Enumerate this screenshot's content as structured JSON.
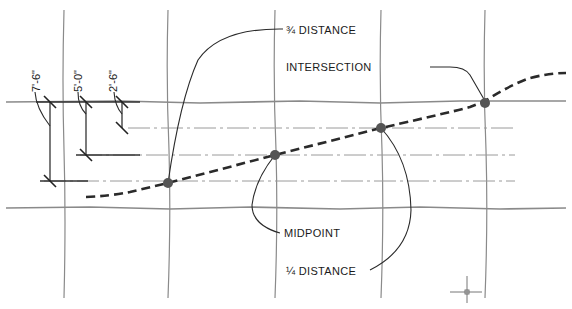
{
  "diagram": {
    "type": "cad-drawing",
    "labels": {
      "three_quarter": "¾ DISTANCE",
      "intersection": "INTERSECTION",
      "midpoint": "MIDPOINT",
      "quarter": "¼ DISTANCE"
    },
    "dimensions": [
      {
        "id": "dim-1",
        "text": "7'-6\""
      },
      {
        "id": "dim-2",
        "text": "5'-0\""
      },
      {
        "id": "dim-3",
        "text": "2'-6\""
      }
    ],
    "grid": {
      "vertical_lines": 5,
      "horizontal_lines": 2,
      "centerlines": 3
    },
    "points": [
      {
        "name": "quarter-distance-point"
      },
      {
        "name": "midpoint"
      },
      {
        "name": "three-quarter-distance-point"
      },
      {
        "name": "intersection-point"
      }
    ],
    "colors": {
      "grid": "#8a8a8a",
      "curve": "#2a2a2a",
      "node": "#555555",
      "background": "#ffffff"
    }
  }
}
